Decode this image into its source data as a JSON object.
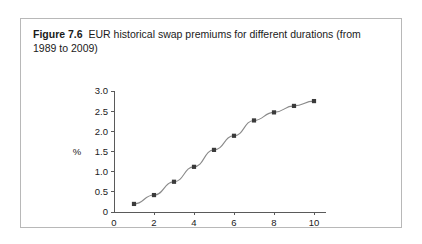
{
  "figure": {
    "label": "Figure 7.6",
    "caption": "EUR historical swap premiums for different durations (from 1989 to 2009)"
  },
  "chart_data": {
    "type": "line",
    "title": "EUR historical swap premiums for different durations (from 1989 to 2009)",
    "xlabel": "Duration (years)",
    "ylabel": "%",
    "x": [
      1,
      2,
      3,
      4,
      5,
      6,
      7,
      8,
      9,
      10
    ],
    "values": [
      0.2,
      0.42,
      0.75,
      1.12,
      1.54,
      1.89,
      2.27,
      2.47,
      2.63,
      2.75
    ],
    "xlim": [
      0,
      10.6
    ],
    "ylim": [
      0,
      3.0
    ],
    "xticks": [
      0,
      2,
      4,
      6,
      8,
      10
    ],
    "xtick_labels": [
      "0",
      "2",
      "4",
      "6",
      "8",
      "10"
    ],
    "yticks": [
      0,
      0.5,
      1.0,
      1.5,
      2.0,
      2.5,
      3.0
    ],
    "ytick_labels": [
      "0",
      "0.5",
      "1.0",
      "1.5",
      "2.0",
      "2.5",
      "3.0"
    ],
    "grid": false,
    "legend": null,
    "marker": "square",
    "line_color": "#8a8a8a",
    "marker_color": "#3b3b3b"
  }
}
